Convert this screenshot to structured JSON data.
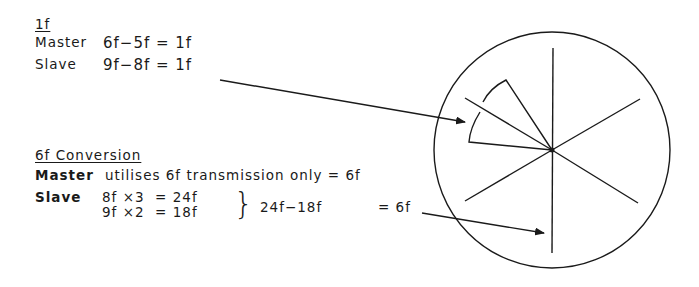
{
  "section_1f": {
    "heading": "1f",
    "master_label": "Master",
    "master_eq": "6f−5f = 1f",
    "slave_label": "Slave",
    "slave_eq": "9f−8f = 1f"
  },
  "section_6f": {
    "heading": "6f Conversion",
    "master_label": "Master",
    "master_text": "utilises 6f transmission only = 6f",
    "slave_label": "Slave",
    "slave_eq1": "8f ×3  = 24f",
    "slave_eq2": "9f ×2  = 18f",
    "brace": "}",
    "difference": "24f−18f",
    "result": "= 6f"
  },
  "diagram": {
    "circle": {
      "cx": 552,
      "cy": 150,
      "r": 118
    },
    "spokes": 6,
    "stroke_color": "#1a1a1a"
  }
}
